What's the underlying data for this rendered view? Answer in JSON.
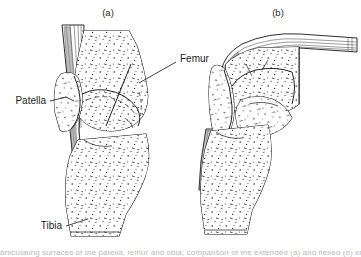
{
  "figure": {
    "kind": "anatomical-line-drawing",
    "panels": [
      {
        "id": "a",
        "label": "(a)",
        "state": "extended knee",
        "label_x": 108,
        "label_y": 16
      },
      {
        "id": "b",
        "label": "(b)",
        "state": "flexed knee",
        "label_x": 278,
        "label_y": 16
      }
    ],
    "structure_labels": [
      {
        "name": "femur",
        "text": "Femur",
        "x": 180,
        "y": 59,
        "anchor": "start",
        "leader": "M176,62 L139,83"
      },
      {
        "name": "patella",
        "text": "Patella",
        "x": 46,
        "y": 103,
        "anchor": "end",
        "leader": "M50,101 L69,96 L74,99"
      },
      {
        "name": "tibia",
        "text": "Tibia",
        "x": 62,
        "y": 228,
        "anchor": "end",
        "leader": "M66,225 L86,219"
      }
    ],
    "caption_partial": "articulating surfaces of the patella, femur and tibia; comparison of the extended (a) and flexed (b) knee",
    "colors": {
      "ink": "#151515",
      "background": "#ffffff",
      "tendon_shade": "#8d8d8d",
      "label_text": "#1d1d1d"
    },
    "icon_names": [
      "leader-line-icon",
      "stipple-texture-icon",
      "tendon-stripe-icon"
    ]
  }
}
